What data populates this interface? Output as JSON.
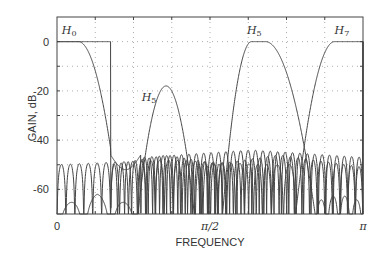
{
  "chart_data": {
    "type": "line",
    "title": "",
    "xlabel": "FREQUENCY",
    "ylabel": "GAIN, dB",
    "xlim": [
      0,
      3.14159
    ],
    "ylim": [
      -70,
      10
    ],
    "x_ticks": [
      {
        "value": 0,
        "label": "0"
      },
      {
        "value": 1.5708,
        "label": "π/2"
      },
      {
        "value": 3.14159,
        "label": "π"
      }
    ],
    "y_ticks": [
      {
        "value": 0,
        "label": "0"
      },
      {
        "value": -20,
        "label": "-20"
      },
      {
        "value": -40,
        "label": "-40"
      },
      {
        "value": -60,
        "label": "-60"
      }
    ],
    "grid": {
      "on": true,
      "style": "dotted",
      "x_step": "π/8",
      "y_step": 10
    },
    "series": [
      {
        "name": "H0",
        "label_main": "H",
        "label_sub": "0",
        "passband": [
          0,
          0.55
        ],
        "passband_gain_db": 0,
        "stopband_peak_db": -45,
        "description": "lowpass filter"
      },
      {
        "name": "H3",
        "label_main": "H",
        "label_sub": "5",
        "center": 1.1,
        "peak_gain_db": -18,
        "stopband_peak_db": -45,
        "description": "bandpass filter (attenuated)"
      },
      {
        "name": "H5",
        "label_main": "H",
        "label_sub": "5",
        "passband": [
          1.95,
          2.2
        ],
        "passband_gain_db": 0,
        "stopband_peak_db": -45,
        "description": "bandpass filter"
      },
      {
        "name": "H7",
        "label_main": "H",
        "label_sub": "7",
        "passband": [
          2.75,
          3.14159
        ],
        "passband_gain_db": 0,
        "stopband_peak_db": -48,
        "description": "highpass filter"
      }
    ],
    "curve_labels": [
      {
        "text_main": "H",
        "text_sub": "0",
        "x": 0.05,
        "y": 3
      },
      {
        "text_main": "H",
        "text_sub": "5",
        "x": 0.87,
        "y": -24
      },
      {
        "text_main": "H",
        "text_sub": "5",
        "x": 1.95,
        "y": 3
      },
      {
        "text_main": "H",
        "text_sub": "7",
        "x": 2.85,
        "y": 3
      }
    ]
  }
}
